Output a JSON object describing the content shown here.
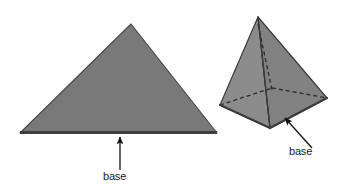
{
  "figure": {
    "background_color": "#ffffff",
    "width": 350,
    "height": 185
  },
  "shapes": {
    "triangle": {
      "name": "triangle",
      "fill_color": "#797979",
      "edge_color": "#4a4a4a",
      "base_edge_color": "#3f3f3f",
      "apex": [
        131,
        24
      ],
      "left_vertex": [
        20,
        133
      ],
      "right_vertex": [
        217,
        133
      ],
      "points": "131,24 217,133 20,133"
    },
    "pyramid": {
      "name": "pyramid",
      "apex": [
        258,
        17
      ],
      "front_vertex": [
        270,
        128
      ],
      "left_vertex": [
        220,
        105
      ],
      "right_vertex": [
        327,
        98
      ],
      "hidden_back_vertex": [
        272,
        88
      ],
      "left_face_color": "#8c8c8c",
      "right_face_color": "#828282",
      "base_face_color": "#565656",
      "base_face_right_color": "#6e6e6e",
      "edge_color": "#3a3a3a",
      "hidden_edge_color": "#2b2b2b",
      "hidden_edge_dash": "4,3"
    }
  },
  "annotations": [
    {
      "id": "triangle-base-label",
      "text": "base",
      "text_x": 103,
      "text_y": 180,
      "arrow_tail": [
        120,
        170
      ],
      "arrow_head": [
        120,
        137
      ]
    },
    {
      "id": "pyramid-base-label",
      "text": "base",
      "text_x": 289,
      "text_y": 155,
      "arrow_tail": [
        312,
        148
      ],
      "arrow_head": [
        285,
        118
      ]
    }
  ],
  "colors": {
    "arrow_color": "#111111",
    "text_color": "#1a1a1a"
  }
}
